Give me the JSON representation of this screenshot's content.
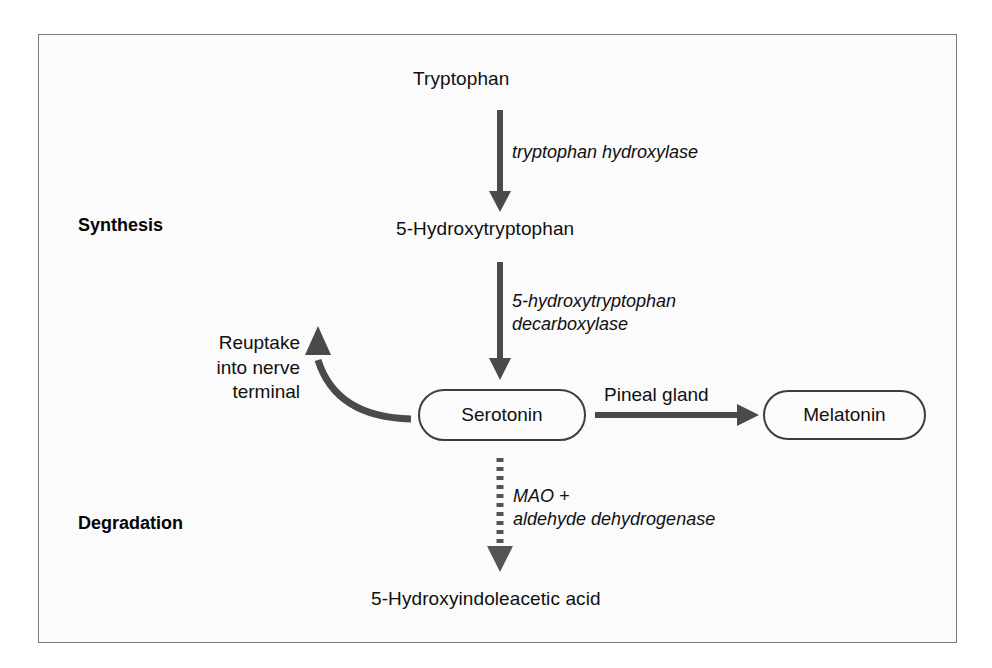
{
  "figure": {
    "frame_color": "#7a7a7a",
    "background": "#fbfbfb",
    "arrow_color": "#4a4a4a",
    "text_color": "#101010"
  },
  "sections": [
    {
      "id": "synthesis",
      "label": "Synthesis"
    },
    {
      "id": "degradation",
      "label": "Degradation"
    }
  ],
  "nodes": [
    {
      "id": "tryptophan",
      "label": "Tryptophan",
      "shape": "plain"
    },
    {
      "id": "hydroxytryptophan",
      "label": "5-Hydroxytryptophan",
      "shape": "plain"
    },
    {
      "id": "serotonin",
      "label": "Serotonin",
      "shape": "rounded-box"
    },
    {
      "id": "melatonin",
      "label": "Melatonin",
      "shape": "rounded-box"
    },
    {
      "id": "hiaa",
      "label": "5-Hydroxyindoleacetic acid",
      "shape": "plain"
    }
  ],
  "edges": [
    {
      "id": "trp-to-5htp",
      "from": "tryptophan",
      "to": "hydroxytryptophan",
      "style": "solid",
      "direction": "down",
      "enzyme_lines": [
        "tryptophan hydroxylase"
      ]
    },
    {
      "id": "5htp-to-serotonin",
      "from": "hydroxytryptophan",
      "to": "serotonin",
      "style": "solid",
      "direction": "down",
      "enzyme_lines": [
        "5-hydroxytryptophan",
        "decarboxylase"
      ]
    },
    {
      "id": "serotonin-to-melatonin",
      "from": "serotonin",
      "to": "melatonin",
      "style": "solid",
      "direction": "right",
      "label": "Pineal gland"
    },
    {
      "id": "serotonin-to-hiaa",
      "from": "serotonin",
      "to": "hiaa",
      "style": "dotted",
      "direction": "down",
      "enzyme_lines": [
        "MAO +",
        "aldehyde dehydrogenase"
      ]
    },
    {
      "id": "reuptake",
      "from": "serotonin",
      "to": "nerve-terminal",
      "style": "curved-solid",
      "direction": "up-left",
      "label_lines": [
        "Reuptake",
        "into nerve",
        "terminal"
      ]
    }
  ]
}
